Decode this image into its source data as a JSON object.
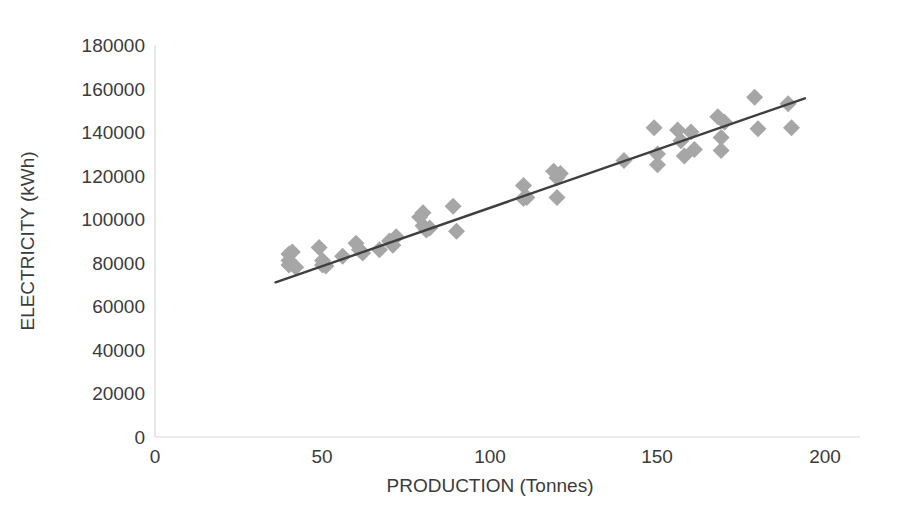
{
  "chart_data": {
    "type": "scatter",
    "title": "",
    "xlabel": "PRODUCTION (Tonnes)",
    "ylabel": "ELECTRICITY (kWh)",
    "xlim": [
      0,
      200
    ],
    "ylim": [
      0,
      180000
    ],
    "xticks": [
      0,
      50,
      100,
      150,
      200
    ],
    "yticks": [
      0,
      20000,
      40000,
      60000,
      80000,
      100000,
      120000,
      140000,
      160000,
      180000
    ],
    "xtick_labels": [
      "0",
      "50",
      "100",
      "150",
      "200"
    ],
    "ytick_labels": [
      "0",
      "20000",
      "40000",
      "60000",
      "80000",
      "100000",
      "120000",
      "140000",
      "160000",
      "180000"
    ],
    "grid": false,
    "legend": false,
    "marker_shape": "diamond",
    "marker_color": "#a6a6a6",
    "trendline_color": "#3f3f3f",
    "axis_color": "#d9d9d9",
    "text_color": "#3b3b3b",
    "series": [
      {
        "name": "Production vs Electricity",
        "points": [
          [
            40,
            84000
          ],
          [
            40,
            81000
          ],
          [
            40,
            79000
          ],
          [
            41,
            85000
          ],
          [
            42,
            78000
          ],
          [
            49,
            87000
          ],
          [
            50,
            81000
          ],
          [
            50,
            79000
          ],
          [
            51,
            78500
          ],
          [
            56,
            83000
          ],
          [
            60,
            89000
          ],
          [
            61,
            86000
          ],
          [
            62,
            84500
          ],
          [
            67,
            86000
          ],
          [
            70,
            90000
          ],
          [
            71,
            88000
          ],
          [
            72,
            92000
          ],
          [
            79,
            101000
          ],
          [
            80,
            97000
          ],
          [
            80,
            103000
          ],
          [
            81,
            95000
          ],
          [
            82,
            96000
          ],
          [
            89,
            106000
          ],
          [
            90,
            94500
          ],
          [
            110,
            115500
          ],
          [
            110,
            109500
          ],
          [
            111,
            110000
          ],
          [
            119,
            122000
          ],
          [
            120,
            119000
          ],
          [
            120,
            110000
          ],
          [
            121,
            121000
          ],
          [
            140,
            127000
          ],
          [
            149,
            142000
          ],
          [
            150,
            130000
          ],
          [
            150,
            125000
          ],
          [
            156,
            141000
          ],
          [
            157,
            136000
          ],
          [
            158,
            129000
          ],
          [
            160,
            140000
          ],
          [
            161,
            132000
          ],
          [
            168,
            147000
          ],
          [
            169,
            137500
          ],
          [
            169,
            131500
          ],
          [
            170,
            144500
          ],
          [
            179,
            156000
          ],
          [
            180,
            141500
          ],
          [
            189,
            153000
          ],
          [
            190,
            142000
          ]
        ]
      }
    ],
    "trendline": {
      "x_start": 36,
      "y_start": 71000,
      "x_end": 194,
      "y_end": 155500,
      "slope": 535,
      "intercept": 51740
    }
  },
  "axis": {
    "x_title": "PRODUCTION (Tonnes)",
    "y_title": "ELECTRICITY (kWh)"
  },
  "ticks": {
    "y": {
      "t180000": "180000",
      "t160000": "160000",
      "t140000": "140000",
      "t120000": "120000",
      "t100000": "100000",
      "t80000": "80000",
      "t60000": "60000",
      "t40000": "40000",
      "t20000": "20000",
      "t0": "0"
    },
    "x": {
      "t0": "0",
      "t50": "50",
      "t100": "100",
      "t150": "150",
      "t200": "200"
    }
  }
}
